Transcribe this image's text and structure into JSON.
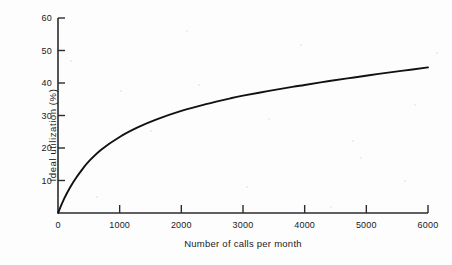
{
  "chart_data": {
    "type": "line",
    "title": "",
    "xlabel": "Number of calls per month",
    "ylabel": "Ideal utilization (%)",
    "xlim": [
      0,
      6000
    ],
    "ylim": [
      0,
      60
    ],
    "grid": false,
    "legend": "none",
    "xticks": [
      0,
      1000,
      2000,
      3000,
      4000,
      5000,
      6000
    ],
    "xtick_labels": [
      "0",
      "1000",
      "2000",
      "3000",
      "4000",
      "5000",
      "6000"
    ],
    "yticks": [
      10,
      20,
      30,
      40,
      50,
      60
    ],
    "ytick_labels": [
      "10",
      "20",
      "30",
      "40",
      "50",
      "60"
    ],
    "series": [
      {
        "name": "Ideal utilization",
        "x": [
          0,
          100,
          200,
          300,
          400,
          500,
          700,
          1000,
          1300,
          1600,
          2000,
          2400,
          2800,
          3000,
          3400,
          3800,
          4000,
          4400,
          4800,
          5200,
          5600,
          6000
        ],
        "values": [
          0,
          4.4,
          8.0,
          11.0,
          13.6,
          15.9,
          19.5,
          23.4,
          26.4,
          28.8,
          31.4,
          33.5,
          35.3,
          36.1,
          37.5,
          38.8,
          39.4,
          40.6,
          41.7,
          42.8,
          43.8,
          44.8
        ]
      }
    ],
    "line_color": "#111111",
    "line_width_px": 1.9,
    "axis_color": "#333333"
  },
  "axis": {
    "x_tick_count": 7,
    "y_tick_count": 6
  }
}
